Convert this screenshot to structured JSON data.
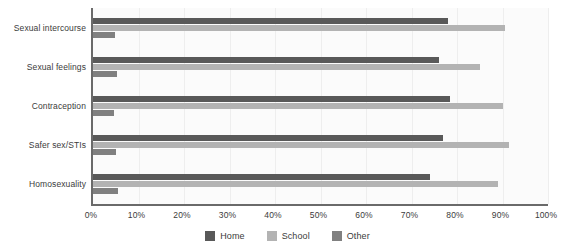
{
  "chart_data": {
    "type": "bar",
    "orientation": "horizontal",
    "title": "",
    "subtitle": "",
    "xlabel": "",
    "ylabel": "",
    "xlim": [
      0,
      100
    ],
    "xtick_labels": [
      "0%",
      "10%",
      "20%",
      "30%",
      "40%",
      "50%",
      "60%",
      "70%",
      "80%",
      "90%",
      "100%"
    ],
    "xtick_values": [
      0,
      10,
      20,
      30,
      40,
      50,
      60,
      70,
      80,
      90,
      100
    ],
    "grid": true,
    "grid_axis": "x",
    "legend_position": "bottom",
    "categories": [
      "Sexual intercourse",
      "Sexual feelings",
      "Contraception",
      "Safer sex/STIs",
      "Homosexuality"
    ],
    "series": [
      {
        "name": "Home",
        "color": "#595959",
        "values": [
          78,
          76,
          78.5,
          77,
          74
        ]
      },
      {
        "name": "School",
        "color": "#b3b3b3",
        "values": [
          90.5,
          85,
          90,
          91.5,
          89
        ]
      },
      {
        "name": "Other",
        "color": "#808080",
        "values": [
          4.8,
          5.2,
          4.6,
          5.0,
          5.5
        ]
      }
    ]
  },
  "legend": {
    "items": [
      {
        "label": "Home",
        "color": "#595959",
        "key": "home"
      },
      {
        "label": "School",
        "color": "#b3b3b3",
        "key": "school"
      },
      {
        "label": "Other",
        "color": "#808080",
        "key": "other"
      }
    ]
  },
  "colors": {
    "home": "#595959",
    "school": "#b3b3b3",
    "other": "#808080",
    "axis": "#6a6a6a",
    "grid": "#eeeeee",
    "plot_background": "#fbfbfb",
    "text": "#3b3b3b"
  }
}
